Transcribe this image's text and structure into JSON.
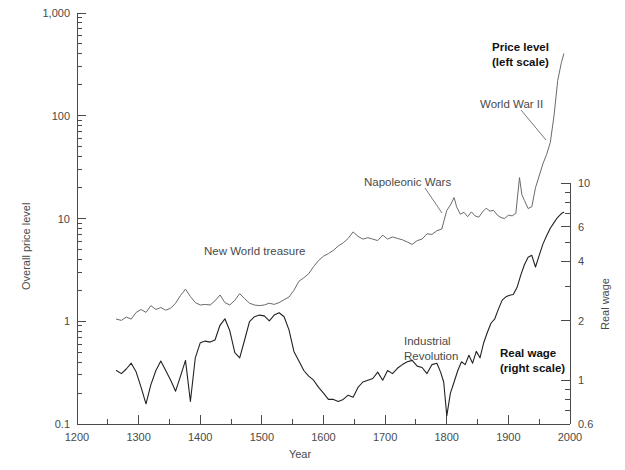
{
  "chart_data": {
    "type": "line",
    "title": "",
    "xlabel": "Year",
    "ylabel": "Overall price level",
    "ylabel_right": "Real wage",
    "xlim": [
      1200,
      2000
    ],
    "ylim_left": [
      0.1,
      1000
    ],
    "ylim_right": [
      0.6,
      10
    ],
    "yscale": "log",
    "grid": false,
    "legend": "inline annotations",
    "xticks": [
      1200,
      1300,
      1400,
      1500,
      1600,
      1700,
      1800,
      1900,
      2000
    ],
    "xticks_minor": [
      1250,
      1350,
      1450,
      1550,
      1650,
      1750,
      1850,
      1950
    ],
    "yticks_left": [
      "1,000",
      "100",
      "10",
      "1",
      "0.1"
    ],
    "yticks_left_values": [
      1000,
      100,
      10,
      1,
      0.1
    ],
    "yticks_right": [
      "10",
      "6",
      "4",
      "2",
      "1",
      "0.6"
    ],
    "yticks_right_values": [
      10,
      6,
      4,
      2,
      1,
      0.6
    ],
    "series": [
      {
        "name": "Price level (left scale)",
        "axis": "left",
        "color": "#6a6a6a",
        "points": [
          [
            1264,
            1.05
          ],
          [
            1272,
            1.02
          ],
          [
            1280,
            1.1
          ],
          [
            1288,
            1.05
          ],
          [
            1296,
            1.22
          ],
          [
            1304,
            1.3
          ],
          [
            1312,
            1.22
          ],
          [
            1320,
            1.42
          ],
          [
            1328,
            1.3
          ],
          [
            1336,
            1.36
          ],
          [
            1344,
            1.28
          ],
          [
            1352,
            1.34
          ],
          [
            1360,
            1.5
          ],
          [
            1368,
            1.78
          ],
          [
            1376,
            2.05
          ],
          [
            1384,
            1.74
          ],
          [
            1392,
            1.52
          ],
          [
            1400,
            1.44
          ],
          [
            1408,
            1.46
          ],
          [
            1416,
            1.44
          ],
          [
            1424,
            1.58
          ],
          [
            1432,
            1.8
          ],
          [
            1440,
            1.52
          ],
          [
            1448,
            1.44
          ],
          [
            1456,
            1.6
          ],
          [
            1464,
            1.86
          ],
          [
            1472,
            1.66
          ],
          [
            1480,
            1.5
          ],
          [
            1488,
            1.44
          ],
          [
            1496,
            1.42
          ],
          [
            1504,
            1.44
          ],
          [
            1512,
            1.5
          ],
          [
            1520,
            1.46
          ],
          [
            1528,
            1.52
          ],
          [
            1536,
            1.62
          ],
          [
            1544,
            1.72
          ],
          [
            1552,
            2.0
          ],
          [
            1560,
            2.45
          ],
          [
            1568,
            2.65
          ],
          [
            1576,
            2.9
          ],
          [
            1584,
            3.4
          ],
          [
            1592,
            3.9
          ],
          [
            1600,
            4.3
          ],
          [
            1608,
            4.55
          ],
          [
            1616,
            4.9
          ],
          [
            1624,
            5.4
          ],
          [
            1632,
            5.8
          ],
          [
            1640,
            6.4
          ],
          [
            1648,
            7.4
          ],
          [
            1656,
            6.7
          ],
          [
            1664,
            6.3
          ],
          [
            1672,
            6.5
          ],
          [
            1680,
            6.3
          ],
          [
            1688,
            6.1
          ],
          [
            1696,
            6.9
          ],
          [
            1704,
            6.3
          ],
          [
            1712,
            6.6
          ],
          [
            1720,
            6.4
          ],
          [
            1728,
            6.2
          ],
          [
            1736,
            5.9
          ],
          [
            1744,
            5.6
          ],
          [
            1752,
            6.1
          ],
          [
            1760,
            6.3
          ],
          [
            1768,
            7.1
          ],
          [
            1776,
            7.0
          ],
          [
            1784,
            7.6
          ],
          [
            1792,
            7.9
          ],
          [
            1800,
            12.0
          ],
          [
            1806,
            13.5
          ],
          [
            1812,
            16.0
          ],
          [
            1816,
            13.0
          ],
          [
            1822,
            11.0
          ],
          [
            1828,
            11.5
          ],
          [
            1834,
            10.4
          ],
          [
            1840,
            11.6
          ],
          [
            1846,
            10.6
          ],
          [
            1852,
            10.3
          ],
          [
            1858,
            11.6
          ],
          [
            1864,
            12.6
          ],
          [
            1870,
            11.8
          ],
          [
            1876,
            12.0
          ],
          [
            1882,
            10.8
          ],
          [
            1888,
            10.2
          ],
          [
            1894,
            10.0
          ],
          [
            1900,
            10.8
          ],
          [
            1906,
            10.6
          ],
          [
            1912,
            11.2
          ],
          [
            1918,
            25.0
          ],
          [
            1922,
            17.0
          ],
          [
            1926,
            15.0
          ],
          [
            1932,
            12.5
          ],
          [
            1938,
            13.0
          ],
          [
            1944,
            20.0
          ],
          [
            1950,
            26.0
          ],
          [
            1956,
            34.0
          ],
          [
            1962,
            42.0
          ],
          [
            1968,
            55.0
          ],
          [
            1974,
            100.0
          ],
          [
            1980,
            220.0
          ],
          [
            1986,
            330.0
          ],
          [
            1990,
            400.0
          ]
        ]
      },
      {
        "name": "Real wage (right scale)",
        "axis": "right",
        "color": "#222222",
        "points": [
          [
            1264,
            1.12
          ],
          [
            1272,
            1.08
          ],
          [
            1280,
            1.14
          ],
          [
            1288,
            1.22
          ],
          [
            1296,
            1.1
          ],
          [
            1304,
            0.92
          ],
          [
            1312,
            0.76
          ],
          [
            1320,
            0.95
          ],
          [
            1328,
            1.12
          ],
          [
            1336,
            1.25
          ],
          [
            1344,
            1.12
          ],
          [
            1352,
            1.0
          ],
          [
            1360,
            0.88
          ],
          [
            1368,
            1.05
          ],
          [
            1376,
            1.26
          ],
          [
            1384,
            0.78
          ],
          [
            1392,
            1.3
          ],
          [
            1400,
            1.55
          ],
          [
            1408,
            1.58
          ],
          [
            1416,
            1.56
          ],
          [
            1424,
            1.6
          ],
          [
            1432,
            1.9
          ],
          [
            1440,
            2.05
          ],
          [
            1448,
            1.78
          ],
          [
            1456,
            1.38
          ],
          [
            1464,
            1.3
          ],
          [
            1472,
            1.6
          ],
          [
            1480,
            1.98
          ],
          [
            1488,
            2.1
          ],
          [
            1496,
            2.14
          ],
          [
            1504,
            2.12
          ],
          [
            1512,
            2.0
          ],
          [
            1520,
            2.14
          ],
          [
            1528,
            2.2
          ],
          [
            1536,
            2.1
          ],
          [
            1544,
            1.8
          ],
          [
            1552,
            1.4
          ],
          [
            1560,
            1.25
          ],
          [
            1568,
            1.12
          ],
          [
            1576,
            1.05
          ],
          [
            1584,
            1.0
          ],
          [
            1592,
            0.92
          ],
          [
            1600,
            0.86
          ],
          [
            1608,
            0.8
          ],
          [
            1616,
            0.8
          ],
          [
            1624,
            0.78
          ],
          [
            1632,
            0.8
          ],
          [
            1640,
            0.84
          ],
          [
            1648,
            0.82
          ],
          [
            1656,
            0.92
          ],
          [
            1664,
            0.98
          ],
          [
            1672,
            1.0
          ],
          [
            1680,
            1.02
          ],
          [
            1688,
            1.1
          ],
          [
            1696,
            1.0
          ],
          [
            1704,
            1.12
          ],
          [
            1712,
            1.08
          ],
          [
            1720,
            1.15
          ],
          [
            1728,
            1.2
          ],
          [
            1736,
            1.24
          ],
          [
            1744,
            1.26
          ],
          [
            1752,
            1.18
          ],
          [
            1760,
            1.16
          ],
          [
            1768,
            1.08
          ],
          [
            1776,
            1.2
          ],
          [
            1784,
            1.22
          ],
          [
            1790,
            1.1
          ],
          [
            1795,
            0.98
          ],
          [
            1800,
            0.66
          ],
          [
            1806,
            0.86
          ],
          [
            1812,
            0.98
          ],
          [
            1818,
            1.12
          ],
          [
            1824,
            1.24
          ],
          [
            1830,
            1.2
          ],
          [
            1836,
            1.34
          ],
          [
            1842,
            1.22
          ],
          [
            1848,
            1.4
          ],
          [
            1854,
            1.3
          ],
          [
            1860,
            1.55
          ],
          [
            1866,
            1.75
          ],
          [
            1872,
            1.95
          ],
          [
            1878,
            2.05
          ],
          [
            1884,
            2.3
          ],
          [
            1890,
            2.55
          ],
          [
            1896,
            2.65
          ],
          [
            1902,
            2.7
          ],
          [
            1908,
            2.72
          ],
          [
            1914,
            2.95
          ],
          [
            1920,
            3.4
          ],
          [
            1926,
            3.85
          ],
          [
            1932,
            4.2
          ],
          [
            1938,
            4.3
          ],
          [
            1944,
            3.75
          ],
          [
            1950,
            4.3
          ],
          [
            1956,
            4.9
          ],
          [
            1962,
            5.4
          ],
          [
            1968,
            5.9
          ],
          [
            1974,
            6.3
          ],
          [
            1980,
            6.7
          ],
          [
            1986,
            7.0
          ],
          [
            1990,
            7.1
          ]
        ]
      }
    ],
    "annotations": [
      {
        "text": "Price level",
        "text2": "(left scale)",
        "bold": true,
        "x": 492,
        "y": 46
      },
      {
        "text": "World War II",
        "bold": false,
        "x": 480,
        "y": 104
      },
      {
        "text": "Napoleonic Wars",
        "bold": false,
        "x": 364,
        "y": 182
      },
      {
        "text": "New World treasure",
        "bold": false,
        "x": 204,
        "y": 251
      },
      {
        "text": "Industrial",
        "text2": "Revolution",
        "bold": false,
        "x": 404,
        "y": 340
      },
      {
        "text": "Real wage",
        "text2": "(right scale)",
        "bold": true,
        "x": 500,
        "y": 352
      }
    ]
  }
}
